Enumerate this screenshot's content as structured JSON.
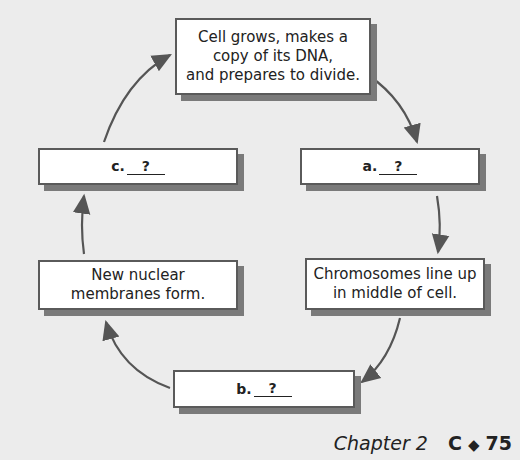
{
  "diagram": {
    "type": "cycle",
    "steps": [
      {
        "id": "top",
        "text": "Cell grows, makes a copy of its DNA, and prepares to divide.",
        "lines": [
          "Cell grows, makes a",
          "copy of its DNA,",
          "and prepares to divide."
        ]
      },
      {
        "id": "a",
        "label": "a.",
        "blank": "?"
      },
      {
        "id": "chromosomes",
        "lines": [
          "Chromosomes line up",
          "in middle of cell."
        ]
      },
      {
        "id": "b",
        "label": "b.",
        "blank": "?"
      },
      {
        "id": "membranes",
        "lines": [
          "New nuclear",
          "membranes form."
        ]
      },
      {
        "id": "c",
        "label": "c.",
        "blank": "?"
      }
    ],
    "arrow_color": "#555555"
  },
  "footer": {
    "chapter": "Chapter 2",
    "section": "C",
    "separator_icon": "diamond-icon",
    "page": "75"
  }
}
